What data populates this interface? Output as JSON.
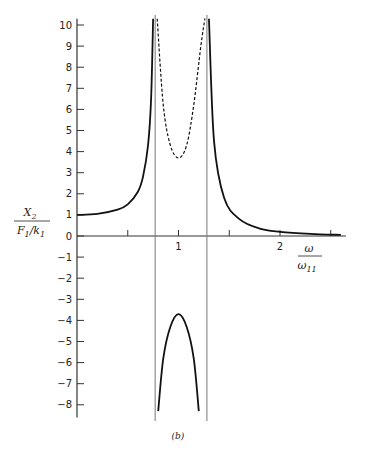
{
  "chart_data": {
    "type": "line",
    "title": "",
    "caption": "(b)",
    "xlabel": {
      "numerator": "ω",
      "denominator": "ω",
      "denominator_sub": "11"
    },
    "ylabel": {
      "numerator": "X",
      "numerator_sub": "2",
      "denominator": "F",
      "denominator_sub": "1",
      "denominator_tail": "/k",
      "denominator_tail_sub": "1"
    },
    "xlim": [
      0,
      2.6
    ],
    "ylim": [
      -8.6,
      10.3
    ],
    "x_ticks": [
      0.5,
      1,
      1.5,
      2,
      2.5
    ],
    "x_tick_labels": [
      {
        "value": 1,
        "label": "1"
      },
      {
        "value": 2,
        "label": "2"
      }
    ],
    "y_ticks": [
      -8,
      -7,
      -6,
      -5,
      -4,
      -3,
      -2,
      -1,
      0,
      1,
      2,
      3,
      4,
      5,
      6,
      7,
      8,
      9,
      10
    ],
    "y_tick_labels": [
      "−8",
      "−7",
      "−6",
      "−5",
      "−4",
      "−3",
      "−2",
      "−1",
      "0",
      "1",
      "2",
      "3",
      "4",
      "5",
      "6",
      "7",
      "8",
      "9",
      "10"
    ],
    "grid": false,
    "asymptotes": [
      0.77,
      1.28
    ],
    "series": [
      {
        "name": "response-low",
        "style": "solid",
        "x": [
          0,
          0.2,
          0.4,
          0.5,
          0.6,
          0.65,
          0.7,
          0.73,
          0.75
        ],
        "y": [
          1.0,
          1.05,
          1.25,
          1.5,
          2.1,
          2.8,
          4.3,
          6.5,
          10.3
        ]
      },
      {
        "name": "response-middle-magnitude",
        "style": "dashed",
        "x": [
          0.79,
          0.85,
          0.92,
          1.0,
          1.08,
          1.15,
          1.22,
          1.26
        ],
        "y": [
          10.3,
          6.2,
          4.3,
          3.7,
          4.3,
          6.2,
          9.0,
          10.3
        ]
      },
      {
        "name": "response-middle",
        "style": "solid",
        "x": [
          0.8,
          0.85,
          0.92,
          1.0,
          1.08,
          1.15,
          1.2
        ],
        "y": [
          -8.3,
          -5.8,
          -4.3,
          -3.7,
          -4.3,
          -5.8,
          -8.3
        ]
      },
      {
        "name": "response-high",
        "style": "solid",
        "x": [
          1.3,
          1.35,
          1.45,
          1.6,
          1.8,
          2.0,
          2.3,
          2.6
        ],
        "y": [
          10.3,
          4.5,
          1.8,
          0.8,
          0.35,
          0.2,
          0.1,
          0.05
        ]
      }
    ],
    "legend": null
  }
}
